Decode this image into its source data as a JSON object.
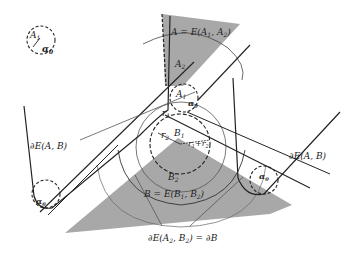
{
  "diagram": {
    "type": "geometric-illustration",
    "labels": {
      "a1_legend": "A",
      "a1_legend_sub": "1",
      "alpha0": "α",
      "alpha0_sub": "0",
      "A_def": "A = E(A",
      "A_def_sub1": "1",
      "A_def_mid": ", A",
      "A_def_sub2": "2",
      "A_def_end": ")",
      "A2": "A",
      "A2_sub": "2",
      "A1": "A",
      "A1_sub": "1",
      "r1": "r",
      "r1_sub": "1",
      "r2": "r",
      "r2_sub": "2",
      "B1": "B",
      "B1_sub": "1",
      "r1r2": "r",
      "r1r2_sub1": "1",
      "r1r2_plus": "+r",
      "r1r2_sub2": "2",
      "B2": "B",
      "B2_sub": "2",
      "B_def": "B = E(B",
      "B_def_sub1": "1",
      "B_def_mid": ", B",
      "B_def_sub2": "2",
      "B_def_end": ")",
      "dE_left": "∂E(A, B)",
      "dE_right": "∂E(A, B)",
      "dE_bottom": "∂E(A",
      "dE_bottom_sub": "2",
      "dE_bottom_mid": ", B",
      "dE_bottom_sub2": "2",
      "dE_bottom_end": ") = ∂B"
    },
    "colors": {
      "stroke": "#222222",
      "fill_region": "#a8a8a8",
      "thin_stroke": "#555555"
    }
  }
}
